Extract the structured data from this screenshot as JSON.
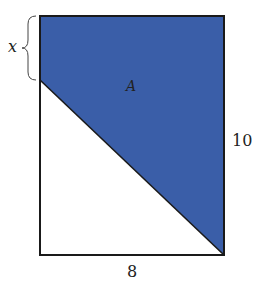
{
  "figure": {
    "shaded_region_label": "A",
    "variable_label": "x",
    "height_label": "10",
    "width_label": "8",
    "shade_color": "#3a5ea8",
    "line_color": "#1a1a1a"
  }
}
